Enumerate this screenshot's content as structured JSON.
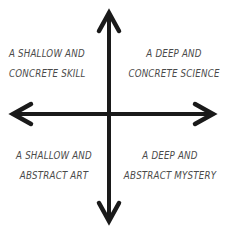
{
  "diagram": {
    "type": "two-axis-quadrant",
    "background_color": "#ffffff",
    "axis_color": "#1a1a1a",
    "text_color": "#4a4a4a",
    "axes": {
      "vertical": {
        "name": "vertical-axis",
        "top_arrow": "arrow-up",
        "bottom_arrow": "arrow-down",
        "x": 109,
        "top_y": 12,
        "bottom_y": 222,
        "thickness": 4
      },
      "horizontal": {
        "name": "horizontal-axis",
        "left_arrow": "arrow-left",
        "right_arrow": "arrow-right",
        "y": 114,
        "left_x": 12,
        "right_x": 214,
        "thickness": 4
      }
    },
    "quadrants": {
      "top_left": {
        "id": "quadrant-top-left",
        "line1": "A SHALLOW AND",
        "line2": "CONCRETE SKILL"
      },
      "top_right": {
        "id": "quadrant-top-right",
        "line1": "A DEEP AND",
        "line2": "CONCRETE SCIENCE"
      },
      "bottom_left": {
        "id": "quadrant-bottom-left",
        "line1": "A SHALLOW AND",
        "line2": "ABSTRACT ART"
      },
      "bottom_right": {
        "id": "quadrant-bottom-right",
        "line1": "A DEEP AND",
        "line2": "ABSTRACT MYSTERY"
      }
    }
  }
}
